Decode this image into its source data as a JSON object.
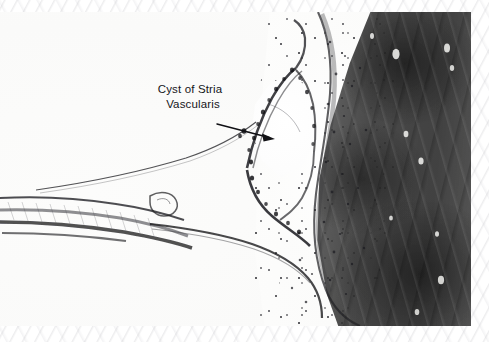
{
  "figure": {
    "kind": "histology-micrograph",
    "modality": "light microscopy",
    "plate": {
      "left": 0,
      "top": 12,
      "width": 471,
      "height": 314
    }
  },
  "annotations": [
    {
      "id": "cyst-of-stria-vascularis",
      "line1": "Cyst of Stria",
      "line2": "Vascularis",
      "leader": {
        "type": "arrow",
        "from_x": 217,
        "from_y": 112,
        "to_x": 274,
        "to_y": 127
      }
    }
  ],
  "structures": [
    {
      "name": "temporal-bone",
      "tone": "dark",
      "region": "right"
    },
    {
      "name": "spiral-ligament",
      "tone": "pale-stippled",
      "region": "center-right"
    },
    {
      "name": "stria-vascularis-cyst",
      "tone": "clear-lumen",
      "region": "center"
    },
    {
      "name": "basilar-membrane",
      "tone": "dark-line",
      "region": "left"
    },
    {
      "name": "reissners-membrane",
      "tone": "thin-line",
      "region": "upper-left"
    },
    {
      "name": "organ-of-corti",
      "tone": "dark-cellular",
      "region": "left"
    },
    {
      "name": "scala-media",
      "tone": "clear",
      "region": "center-lower"
    }
  ],
  "colors": {
    "paper": "#ffffff",
    "bone_dark": "#3c3c3c",
    "tissue_pale": "#fbfbfa",
    "membrane_ink": "#1c1c20",
    "label_ink": "#16161a"
  }
}
